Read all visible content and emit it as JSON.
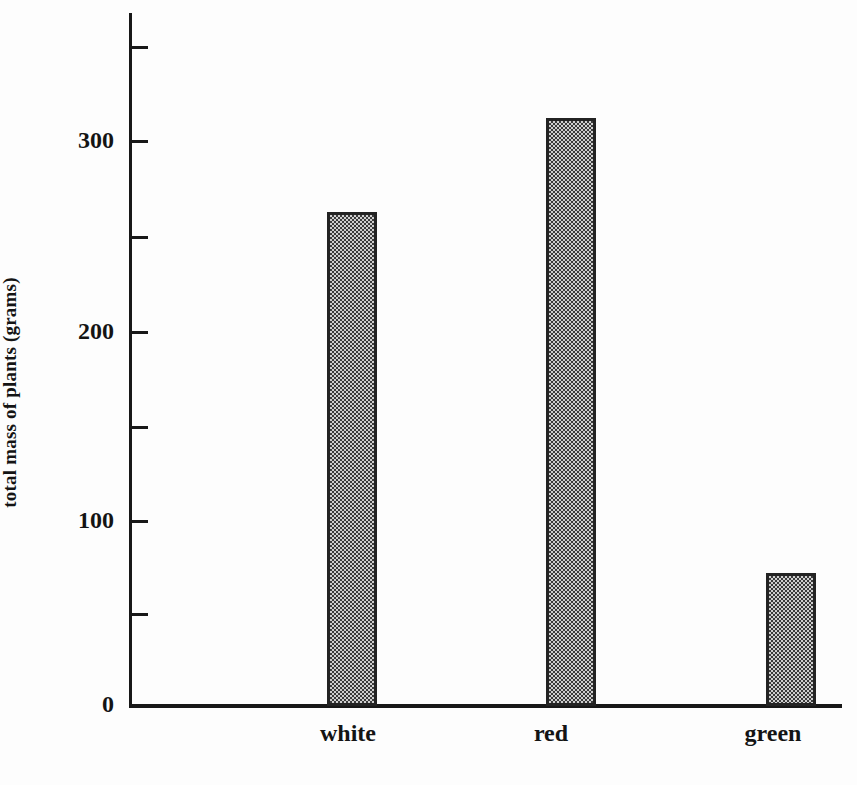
{
  "chart_data": {
    "type": "bar",
    "title": "",
    "subtitle": "",
    "xlabel": "",
    "ylabel": "total mass of plants (grams)",
    "categories": [
      "white",
      "red",
      "green"
    ],
    "values": [
      263,
      313,
      71
    ],
    "series": [
      {
        "name": "total mass of plants",
        "values": [
          263,
          313,
          71
        ]
      }
    ],
    "ylim": [
      0,
      370
    ],
    "y_major_ticks": [
      0,
      100,
      200,
      300
    ],
    "y_minor_ticks": [
      50,
      150,
      250,
      350
    ],
    "y_tick_labels": [
      "0",
      "100",
      "200",
      "300"
    ],
    "grid": false,
    "legend": false,
    "legend_position": "none",
    "bar_fill": "#8a8a8a",
    "bar_fill_pattern": "checkerboard-dither",
    "bar_border_color": "#232323",
    "axis_color": "#181818",
    "background_color": "#fdfdfd",
    "text_color": "#141414"
  },
  "axes": {
    "y_title": "total mass of plants (grams)",
    "y_ticks": [
      {
        "label": "300",
        "value": 300
      },
      {
        "label": "200",
        "value": 200
      },
      {
        "label": "100",
        "value": 100
      },
      {
        "label": "0",
        "value": 0
      }
    ],
    "x_ticks": [
      {
        "label": "white"
      },
      {
        "label": "red"
      },
      {
        "label": "green"
      }
    ]
  }
}
